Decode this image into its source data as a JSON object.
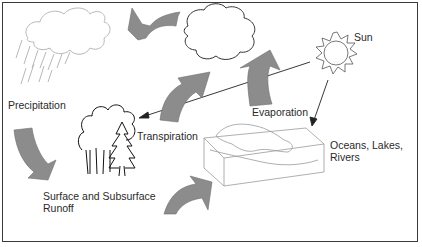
{
  "diagram": {
    "type": "water-cycle",
    "labels": {
      "sun": "Sun",
      "evaporation": "Evaporation",
      "precipitation": "Precipitation",
      "transpiration": "Transpiration",
      "runoff_line1": "Surface and Subsurface",
      "runoff_line2": "Runoff",
      "water_line1": "Oceans, Lakes,",
      "water_line2": "Rivers"
    },
    "colors": {
      "arrow_fill": "#8c8c8c",
      "line": "#222222",
      "light_line": "#b0b0b0",
      "border": "#3a3a3a"
    },
    "nodes": [
      "rain-cloud",
      "white-cloud",
      "sun",
      "trees",
      "water-body"
    ],
    "flows": [
      {
        "from": "white-cloud",
        "to": "rain-cloud"
      },
      {
        "from": "rain-cloud",
        "to": "trees",
        "label": "Precipitation"
      },
      {
        "from": "trees",
        "to": "white-cloud",
        "label": "Transpiration"
      },
      {
        "from": "water-body",
        "to": "white-cloud",
        "label": "Evaporation"
      },
      {
        "from": "trees",
        "to": "water-body",
        "label": "Surface and Subsurface Runoff"
      },
      {
        "from": "sun",
        "to": "trees"
      },
      {
        "from": "sun",
        "to": "water-body"
      }
    ]
  }
}
